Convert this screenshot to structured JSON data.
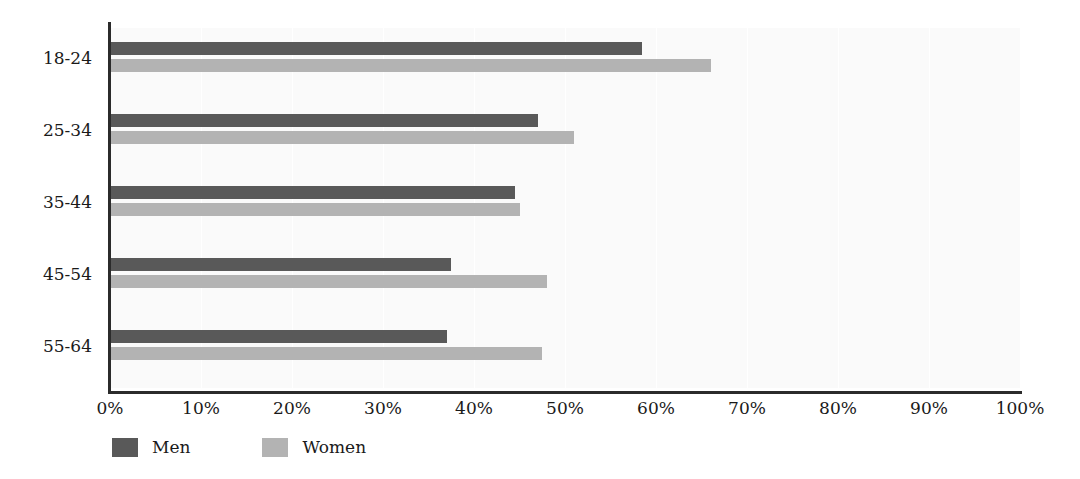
{
  "chart_data": {
    "type": "bar",
    "orientation": "horizontal",
    "title": "",
    "subtitle": "",
    "xlabel": "",
    "ylabel": "",
    "xlim": [
      0,
      100
    ],
    "xtick_labels": [
      "0%",
      "10%",
      "20%",
      "30%",
      "40%",
      "50%",
      "60%",
      "70%",
      "80%",
      "90%",
      "100%"
    ],
    "xtick_values": [
      0,
      10,
      20,
      30,
      40,
      50,
      60,
      70,
      80,
      90,
      100
    ],
    "categories": [
      "18-24",
      "25-34",
      "35-44",
      "45-54",
      "55-64"
    ],
    "grid": "vertical",
    "legend_position": "bottom-left",
    "series": [
      {
        "name": "Men",
        "color": "#595959",
        "values": [
          58.5,
          47.0,
          44.5,
          37.5,
          37.0
        ]
      },
      {
        "name": "Women",
        "color": "#b3b3b3",
        "values": [
          66.0,
          51.0,
          45.0,
          48.0,
          47.5
        ]
      }
    ]
  },
  "legend": {
    "items": [
      {
        "label": "Men",
        "color": "#595959"
      },
      {
        "label": "Women",
        "color": "#b3b3b3"
      }
    ]
  },
  "colors": {
    "men": "#595959",
    "women": "#b3b3b3",
    "axis": "#2b2b2b",
    "plot_background": "#fafafa",
    "page_background": "#ffffff",
    "gridline": "#ffffff",
    "text": "#1a1a1a"
  }
}
